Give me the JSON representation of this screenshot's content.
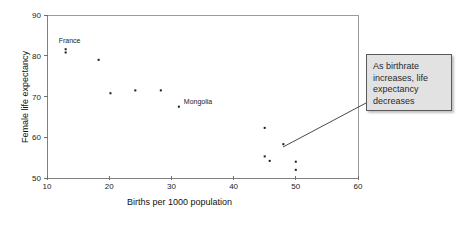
{
  "chart_data": {
    "type": "scatter",
    "title": "",
    "xlabel": "Births per 1000 population",
    "ylabel": "Female life expectancy",
    "xlim": [
      10,
      60
    ],
    "ylim": [
      50,
      90
    ],
    "xticks": [
      10,
      20,
      30,
      40,
      50,
      60
    ],
    "yticks": [
      50,
      60,
      70,
      80,
      90
    ],
    "grid": false,
    "legend": null,
    "points": [
      {
        "x": 13.0,
        "y": 81.6,
        "label": "France"
      },
      {
        "x": 13.0,
        "y": 80.8,
        "label": ""
      },
      {
        "x": 18.3,
        "y": 79.0,
        "label": ""
      },
      {
        "x": 20.2,
        "y": 70.8,
        "label": ""
      },
      {
        "x": 24.2,
        "y": 71.5,
        "label": ""
      },
      {
        "x": 28.3,
        "y": 71.5,
        "label": ""
      },
      {
        "x": 31.2,
        "y": 67.5,
        "label": "Mongolia"
      },
      {
        "x": 45.0,
        "y": 62.3,
        "label": ""
      },
      {
        "x": 48.0,
        "y": 58.3,
        "label": ""
      },
      {
        "x": 45.0,
        "y": 55.3,
        "label": ""
      },
      {
        "x": 45.8,
        "y": 54.2,
        "label": ""
      },
      {
        "x": 50.0,
        "y": 54.0,
        "label": ""
      },
      {
        "x": 50.0,
        "y": 52.0,
        "label": ""
      }
    ],
    "annotations": [
      {
        "name": "trend-callout",
        "text": "As birthrate increases, life expectancy decreases",
        "points_to": {
          "x": 48.0,
          "y": 58.3
        }
      }
    ],
    "colors": {
      "point": "#1a1a1a",
      "axis": "#808080",
      "callout_fill": "#e2e2e2",
      "callout_border": "#5a5a5a",
      "text": "#1a1a1a"
    }
  },
  "labels": {
    "france": "France",
    "mongolia": "Mongolia",
    "x_axis_title": "Births per 1000 population",
    "y_axis_title": "Female life expectancy"
  },
  "ticks": {
    "x": [
      "10",
      "20",
      "30",
      "40",
      "50",
      "60"
    ],
    "y": [
      "50",
      "60",
      "70",
      "80",
      "90"
    ]
  },
  "callout": {
    "text": "As birthrate increases, life expectancy decreases"
  }
}
